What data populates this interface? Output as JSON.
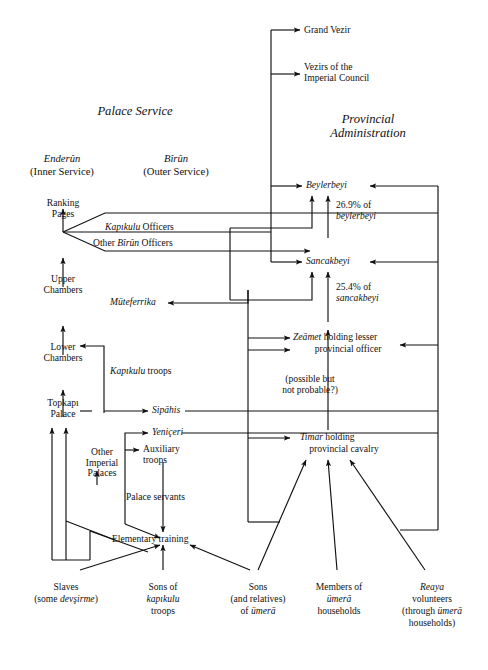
{
  "figure": {
    "domain": "diagram",
    "type": "organizational-flow-chart",
    "background": "#ffffff",
    "ink": "#111111",
    "sections": {
      "palace_service": "Palace Service",
      "provincial_administration": "Provincial\nAdministration"
    },
    "columns": {
      "enderun": "Enderûn",
      "enderun_sub": "(Inner Service)",
      "birun": "Bîrûn",
      "birun_sub": "(Outer Service)"
    },
    "nodes": {
      "grand_vezir": "Grand Vezir",
      "vezirs_council": "Vezirs of the\nImperial Council",
      "beylerbeyi": "Beylerbeyi",
      "sancakbeyi": "Sancakbeyi",
      "ranking_pages": "Ranking\nPages",
      "upper_chambers": "Upper\nChambers",
      "lower_chambers": "Lower\nChambers",
      "topkapi_palace": "Topkapı\nPalace",
      "other_imperial_palaces": "Other\nImperial\nPalaces",
      "kapikulu_officers_a": "Kapıkulu",
      "kapikulu_officers_b": " Officers",
      "other_birun_officers_a": "Other ",
      "other_birun_officers_b": "Bîrûn",
      "other_birun_officers_c": " Officers",
      "muteferrika": "Müteferrika",
      "kapikulu_troops": "Kapıkulu",
      "kapikulu_troops_b": " troops",
      "sipahis": "Sipāhis",
      "yeniceri": "Yeniçeri",
      "auxiliary_troops": "Auxiliary\ntroops",
      "palace_servants": "Palace servants",
      "elementary_training": "Elementary training",
      "zeamet_a": "Zeāmet",
      "zeamet_b": " holding lesser",
      "zeamet_c": "provincial officer",
      "timar_a": "Timar",
      "timar_b": " holding",
      "timar_c": "provincial cavalry",
      "possible_note": "(possible but\nnot probable?)"
    },
    "annotations": {
      "pct_beylerbeyi_num": "26.9% of",
      "pct_beylerbeyi_who": "beylerbeyi",
      "pct_sancakbeyi_num": "25.4% of",
      "pct_sancakbeyi_who": "sancakbeyi"
    },
    "sources": {
      "slaves_l1": "Slaves",
      "slaves_l2a": "(some ",
      "slaves_l2b": "devşirme",
      "slaves_l2c": ")",
      "sons_kapikulu_l1": "Sons of",
      "sons_kapikulu_l2": "kapıkulu",
      "sons_kapikulu_l3": "troops",
      "sons_umera_l1": "Sons",
      "sons_umera_l2": "(and relatives)",
      "sons_umera_l3a": "of ",
      "sons_umera_l3b": "ümerā",
      "members_umera_l1": "Members of",
      "members_umera_l2": "ümerā",
      "members_umera_l3": "households",
      "reaya_l1": "Reaya",
      "reaya_l2": "volunteers",
      "reaya_l3a": "(through ",
      "reaya_l3b": "ümerā",
      "reaya_l4": "households)"
    }
  }
}
